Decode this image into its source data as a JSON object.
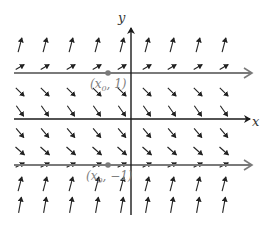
{
  "diagram": {
    "type": "slope-field",
    "axes": {
      "x_label": "x",
      "y_label": "y",
      "origin_px": [
        131,
        119
      ],
      "x_axis_end_px": 250,
      "y_axis_top_px": 28,
      "y_axis_bottom_px": 215,
      "x_axis_start_px": 14
    },
    "equilibrium_lines": [
      {
        "y_px": 73,
        "label": "(x₀, 1)",
        "label_main": "(x",
        "label_sub": "0",
        "label_tail": ", 1)",
        "point_x_px": 108
      },
      {
        "y_px": 165,
        "label": "(x₀, −1)",
        "label_main": "(x",
        "label_sub": "0",
        "label_tail": ", −1)",
        "point_x_px": 108
      }
    ],
    "columns_px": [
      20,
      45,
      71,
      97,
      122,
      147,
      172,
      198,
      224
    ],
    "rows": [
      {
        "y_px": 45,
        "angle_deg": -75,
        "length": 15
      },
      {
        "y_px": 67,
        "angle_deg": -30,
        "length": 10
      },
      {
        "y_px": 92,
        "angle_deg": 45,
        "length": 12
      },
      {
        "y_px": 111,
        "angle_deg": 55,
        "length": 13
      },
      {
        "y_px": 133,
        "angle_deg": 50,
        "length": 12
      },
      {
        "y_px": 151,
        "angle_deg": 42,
        "length": 12
      },
      {
        "y_px": 165,
        "angle_deg": -28,
        "length": 10
      },
      {
        "y_px": 184,
        "angle_deg": -75,
        "length": 15
      },
      {
        "y_px": 205,
        "angle_deg": -80,
        "length": 16
      }
    ],
    "colors": {
      "axis": "#1a1a1a",
      "equilibrium_line": "#7a7a7a",
      "label": "#7f7f7f",
      "arrow": "#222222",
      "point": "#7a7a7a"
    }
  }
}
